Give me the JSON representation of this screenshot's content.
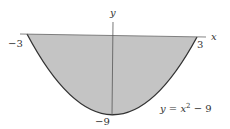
{
  "diagram": {
    "axis_x_label": "x",
    "axis_y_label": "y",
    "tick_left": "−3",
    "tick_right": "3",
    "tick_bottom": "−9",
    "equation": {
      "lhs": "y = x",
      "exp": "2",
      "rhs": " − 9"
    },
    "colors": {
      "fill": "#c4c4c4",
      "curve": "#333333",
      "axis": "#555555"
    }
  }
}
